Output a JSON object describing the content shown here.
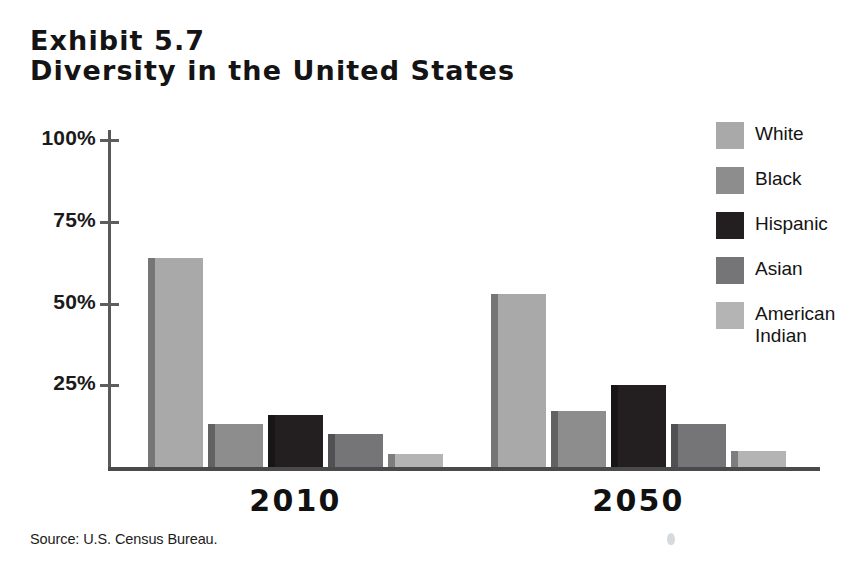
{
  "title": {
    "line1": "Exhibit 5.7",
    "line2": "Diversity in the United States"
  },
  "source": "Source: U.S. Census Bureau.",
  "legend": {
    "items": [
      {
        "label": "White",
        "color": "#a9a9a9"
      },
      {
        "label": "Black",
        "color": "#8d8d8d"
      },
      {
        "label": "Hispanic",
        "color": "#231f20"
      },
      {
        "label": "Asian",
        "color": "#757577"
      },
      {
        "label": "American\nIndian",
        "color": "#b4b4b4"
      }
    ]
  },
  "axis": {
    "y_ticks": [
      "100%",
      "75%",
      "50%",
      "25%"
    ],
    "x_labels": [
      "2010",
      "2050"
    ]
  },
  "chart_data": {
    "type": "bar",
    "subtitle": "",
    "xlabel": "",
    "ylabel": "",
    "categories": [
      "2010",
      "2050"
    ],
    "ylim": [
      0,
      100
    ],
    "ytick_values": [
      25,
      50,
      75,
      100
    ],
    "ytick_labels": [
      "25%",
      "50%",
      "75%",
      "100%"
    ],
    "grid": false,
    "legend_position": "right",
    "units": "percent of U.S. population",
    "source": "U.S. Census Bureau",
    "series": [
      {
        "name": "White",
        "color": "#a9a9a9",
        "values": [
          64,
          53
        ]
      },
      {
        "name": "Black",
        "color": "#8d8d8d",
        "values": [
          13,
          17
        ]
      },
      {
        "name": "Hispanic",
        "color": "#231f20",
        "values": [
          16,
          25
        ]
      },
      {
        "name": "Asian",
        "color": "#757577",
        "values": [
          10,
          13
        ]
      },
      {
        "name": "American Indian",
        "color": "#b4b4b4",
        "values": [
          4,
          5
        ]
      }
    ]
  },
  "geometry": {
    "baseline_y": 467,
    "px_per_percent": 3.27,
    "bar_width": 55,
    "bar_gap": 5,
    "group_start_x": [
      148,
      491
    ],
    "group_label_y": 483
  }
}
